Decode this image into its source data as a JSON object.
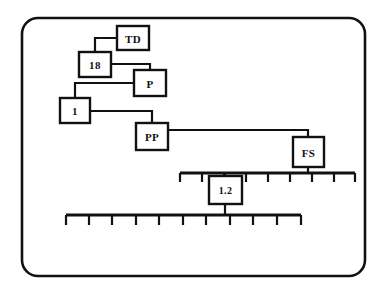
{
  "diagram": {
    "background_color": "#ffffff",
    "line_color": "#111111",
    "frame": {
      "name": "rounded-frame",
      "x": 22,
      "y": 18,
      "width": 343,
      "height": 258,
      "radius": 16
    },
    "nodes": [
      {
        "id": "td",
        "label": "TD",
        "x": 117,
        "y": 26,
        "width": 32,
        "height": 24
      },
      {
        "id": "n18",
        "label": "18",
        "x": 79,
        "y": 52,
        "width": 32,
        "height": 25
      },
      {
        "id": "p",
        "label": "P",
        "x": 134,
        "y": 70,
        "width": 32,
        "height": 26
      },
      {
        "id": "n1",
        "label": "1",
        "x": 60,
        "y": 98,
        "width": 30,
        "height": 25
      },
      {
        "id": "pp",
        "label": "PP",
        "x": 136,
        "y": 123,
        "width": 32,
        "height": 27
      },
      {
        "id": "fs",
        "label": "FS",
        "x": 293,
        "y": 137,
        "width": 31,
        "height": 30
      },
      {
        "id": "n12",
        "label": "1.2",
        "x": 209,
        "y": 176,
        "width": 33,
        "height": 28
      }
    ],
    "connectors": [
      {
        "id": "td-to-18",
        "from": "TD",
        "to": "18",
        "path": "M 117 38 L 95 38 L 95 52"
      },
      {
        "id": "18-to-p",
        "from": "18",
        "to": "P",
        "path": "M 111 64 L 150 64 L 150 70"
      },
      {
        "id": "p-to-1",
        "from": "P",
        "to": "1",
        "path": "M 134 83 L 75 83 L 75 98"
      },
      {
        "id": "1-to-pp",
        "from": "1",
        "to": "PP",
        "path": "M 90 111 L 152 111 L 152 123"
      },
      {
        "id": "pp-to-fs",
        "from": "PP",
        "to": "FS",
        "path": "M 168 130 L 308 130 L 308 137"
      },
      {
        "id": "fs-to-ruler-top",
        "from": "FS",
        "to": "upper-scale",
        "path": "M 308 167 L 308 173"
      },
      {
        "id": "12-to-ruler-top",
        "from": "1.2",
        "to": "upper-scale",
        "path": "M 225 173 L 225 176"
      },
      {
        "id": "12-to-ruler-bottom",
        "from": "1.2",
        "to": "lower-scale",
        "path": "M 225 204 L 225 215"
      }
    ],
    "scales": [
      {
        "id": "upper-scale",
        "name": "upper-scale-bar",
        "y": 173,
        "x_start": 180,
        "x_end": 355,
        "tick_direction": "down",
        "tick_length": 9,
        "tick_count": 9,
        "tick_positions": [
          180,
          202,
          224,
          246,
          268,
          290,
          312,
          334,
          355
        ]
      },
      {
        "id": "lower-scale",
        "name": "lower-scale-bar",
        "y": 215,
        "x_start": 66,
        "x_end": 301,
        "tick_direction": "down",
        "tick_length": 10,
        "tick_count": 11,
        "tick_positions": [
          66,
          89,
          112,
          136,
          159,
          183,
          206,
          230,
          253,
          277,
          301
        ]
      }
    ]
  }
}
